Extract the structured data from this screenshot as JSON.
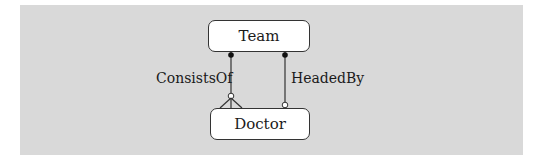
{
  "diagram": {
    "type": "entity-relationship",
    "entities": [
      {
        "id": "team",
        "label": "Team"
      },
      {
        "id": "doctor",
        "label": "Doctor"
      }
    ],
    "relationships": [
      {
        "label": "ConsistsOf",
        "from": "Team",
        "to": "Doctor",
        "from_end": "one (filled dot)",
        "to_end": "many optional (open circle + crow's foot)"
      },
      {
        "label": "HeadedBy",
        "from": "Team",
        "to": "Doctor",
        "from_end": "one (filled dot)",
        "to_end": "optional one (open circle)"
      }
    ]
  },
  "colors": {
    "panel": "#d9d9d9",
    "entity_fill": "#ffffff",
    "line": "#333333"
  }
}
